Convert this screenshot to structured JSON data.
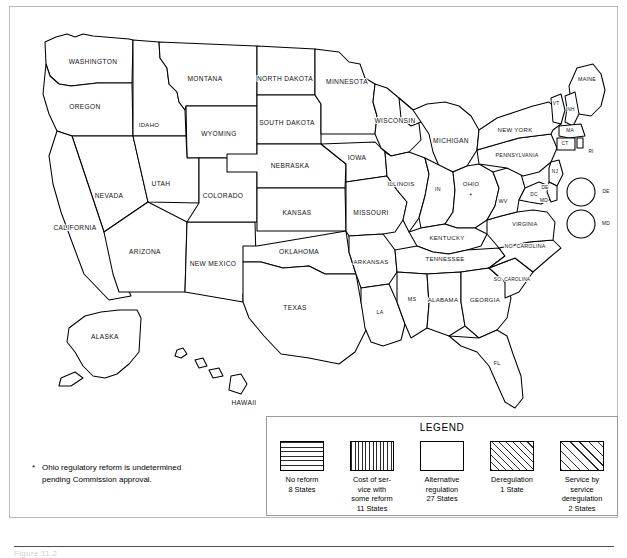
{
  "map": {
    "title": "US state telecommunications regulatory reform map",
    "note_marker": "*",
    "footnote_line1": "Ohio regulatory reform is undetermined",
    "footnote_line2": "pending Commission approval.",
    "caption": "Figure 11.2"
  },
  "legend": {
    "title": "LEGEND",
    "items": [
      {
        "pattern": "horizontal",
        "line1": "No reform",
        "line2": "8 States"
      },
      {
        "pattern": "vertical",
        "line1": "Cost of ser-",
        "line2": "vice with",
        "line3": "some reform",
        "line4": "11 States"
      },
      {
        "pattern": "blank",
        "line1": "Alternative",
        "line2": "regulation",
        "line3": "27 States"
      },
      {
        "pattern": "diagonal-fine",
        "line1": "Deregulation",
        "line2": "1 State"
      },
      {
        "pattern": "diagonal-wide",
        "line1": "Service by",
        "line2": "service",
        "line3": "deregulation",
        "line4": "2 States"
      }
    ]
  },
  "insets": {
    "de": {
      "label": "DE",
      "pattern": "horizontal"
    },
    "md": {
      "label": "MD",
      "pattern": "blank"
    }
  },
  "states": [
    {
      "id": "WA",
      "label": "WASHINGTON",
      "pattern": "blank"
    },
    {
      "id": "OR",
      "label": "OREGON",
      "pattern": "blank"
    },
    {
      "id": "ID",
      "label": "IDAHO",
      "pattern": "vertical"
    },
    {
      "id": "MT",
      "label": "MONTANA",
      "pattern": "vertical"
    },
    {
      "id": "WY",
      "label": "WYOMING",
      "pattern": "vertical"
    },
    {
      "id": "ND",
      "label": "NORTH DAKOTA",
      "pattern": "blank"
    },
    {
      "id": "SD",
      "label": "SOUTH DAKOTA",
      "pattern": "vertical"
    },
    {
      "id": "MN",
      "label": "MINNESOTA",
      "pattern": "blank"
    },
    {
      "id": "WI",
      "label": "WISCONSIN",
      "pattern": "blank"
    },
    {
      "id": "MI",
      "label": "MICHIGAN",
      "pattern": "blank"
    },
    {
      "id": "NV",
      "label": "NEVADA",
      "pattern": "blank"
    },
    {
      "id": "UT",
      "label": "UTAH",
      "pattern": "blank"
    },
    {
      "id": "CO",
      "label": "COLORADO",
      "pattern": "vertical"
    },
    {
      "id": "NE",
      "label": "NEBRASKA",
      "pattern": "diagonal-wide"
    },
    {
      "id": "IA",
      "label": "IOWA",
      "pattern": "diagonal-wide"
    },
    {
      "id": "CA",
      "label": "CALIFORNIA",
      "pattern": "blank"
    },
    {
      "id": "AZ",
      "label": "ARIZONA",
      "pattern": "diagonal-wide"
    },
    {
      "id": "NM",
      "label": "NEW MEXICO",
      "pattern": "blank"
    },
    {
      "id": "KS",
      "label": "KANSAS",
      "pattern": "blank"
    },
    {
      "id": "MO",
      "label": "MISSOURI",
      "pattern": "blank"
    },
    {
      "id": "IL",
      "label": "ILLINOIS",
      "pattern": "blank"
    },
    {
      "id": "IN",
      "label": "IN",
      "pattern": "vertical"
    },
    {
      "id": "OH",
      "label": "OHIO",
      "pattern": "blank"
    },
    {
      "id": "KY",
      "label": "KENTUCKY",
      "pattern": "blank"
    },
    {
      "id": "OK",
      "label": "OKLAHOMA",
      "pattern": "blank"
    },
    {
      "id": "AR",
      "label": "ARKANSAS",
      "pattern": "horizontal"
    },
    {
      "id": "TX",
      "label": "TEXAS",
      "pattern": "blank"
    },
    {
      "id": "LA",
      "label": "LA",
      "pattern": "horizontal"
    },
    {
      "id": "MS",
      "label": "MS",
      "pattern": "blank"
    },
    {
      "id": "AL",
      "label": "ALABAMA",
      "pattern": "blank"
    },
    {
      "id": "TN",
      "label": "TENNESSEE",
      "pattern": "blank"
    },
    {
      "id": "GA",
      "label": "GEORGIA",
      "pattern": "blank"
    },
    {
      "id": "FL",
      "label": "FL",
      "pattern": "blank"
    },
    {
      "id": "SC",
      "label": "SO. CAROLINA",
      "pattern": "vertical"
    },
    {
      "id": "NC",
      "label": "NO. CAROLINA",
      "pattern": "horizontal"
    },
    {
      "id": "VA",
      "label": "VIRGINIA",
      "pattern": "vertical"
    },
    {
      "id": "WV",
      "label": "WV",
      "pattern": "blank"
    },
    {
      "id": "PA",
      "label": "PENNSYLVANIA",
      "pattern": "horizontal"
    },
    {
      "id": "NY",
      "label": "NEW YORK",
      "pattern": "blank"
    },
    {
      "id": "ME",
      "label": "MAINE",
      "pattern": "horizontal"
    },
    {
      "id": "VT",
      "label": "VT",
      "pattern": "vertical"
    },
    {
      "id": "NH",
      "label": "NH",
      "pattern": "vertical"
    },
    {
      "id": "MA",
      "label": "MA",
      "pattern": "horizontal"
    },
    {
      "id": "CT",
      "label": "CT",
      "pattern": "vertical"
    },
    {
      "id": "RI",
      "label": "RI",
      "pattern": "blank"
    },
    {
      "id": "NJ",
      "label": "NJ",
      "pattern": "vertical"
    },
    {
      "id": "DC",
      "label": "DC",
      "pattern": "blank"
    },
    {
      "id": "DE",
      "label": "DE",
      "pattern": "horizontal"
    },
    {
      "id": "MD",
      "label": "MD",
      "pattern": "blank"
    },
    {
      "id": "AK",
      "label": "ALASKA",
      "pattern": "horizontal"
    },
    {
      "id": "HI",
      "label": "HAWAII",
      "pattern": "blank"
    }
  ]
}
